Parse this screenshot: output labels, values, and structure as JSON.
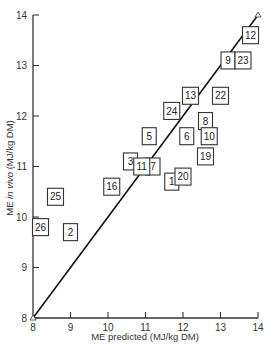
{
  "chart_data": {
    "type": "scatter",
    "title": "",
    "xlabel": "ME predicted (MJ/kg DM)",
    "ylabel_parts": [
      "ME ",
      "in vivo",
      " (MJ/kg DM)"
    ],
    "ylabel": "ME in vivo (MJ/kg DM)",
    "xlim": [
      8,
      14
    ],
    "ylim": [
      8,
      14
    ],
    "x_ticks": [
      8,
      9,
      10,
      11,
      12,
      13,
      14
    ],
    "y_ticks": [
      8,
      9,
      10,
      11,
      12,
      13,
      14
    ],
    "grid": false,
    "legend": null,
    "reference_line": {
      "name": "line of equality (y = x)",
      "from": [
        8,
        8
      ],
      "to": [
        14,
        14
      ]
    },
    "marker_style": "numbered square box",
    "points": [
      {
        "label": "1",
        "x": 11.7,
        "y": 10.7
      },
      {
        "label": "2",
        "x": 9.0,
        "y": 9.7
      },
      {
        "label": "3",
        "x": 10.6,
        "y": 11.1
      },
      {
        "label": "5",
        "x": 11.1,
        "y": 11.6
      },
      {
        "label": "6",
        "x": 12.1,
        "y": 11.6
      },
      {
        "label": "7",
        "x": 11.2,
        "y": 11.0
      },
      {
        "label": "8",
        "x": 12.6,
        "y": 11.9
      },
      {
        "label": "9",
        "x": 13.2,
        "y": 13.1
      },
      {
        "label": "10",
        "x": 12.7,
        "y": 11.6
      },
      {
        "label": "11",
        "x": 10.9,
        "y": 11.0
      },
      {
        "label": "12",
        "x": 13.8,
        "y": 13.6
      },
      {
        "label": "13",
        "x": 12.2,
        "y": 12.4
      },
      {
        "label": "16",
        "x": 10.1,
        "y": 10.6
      },
      {
        "label": "19",
        "x": 12.6,
        "y": 11.2
      },
      {
        "label": "20",
        "x": 12.0,
        "y": 10.8
      },
      {
        "label": "22",
        "x": 13.0,
        "y": 12.4
      },
      {
        "label": "23",
        "x": 13.6,
        "y": 13.1
      },
      {
        "label": "24",
        "x": 11.7,
        "y": 12.1
      },
      {
        "label": "25",
        "x": 8.6,
        "y": 10.4
      },
      {
        "label": "26",
        "x": 8.2,
        "y": 9.8
      }
    ]
  }
}
